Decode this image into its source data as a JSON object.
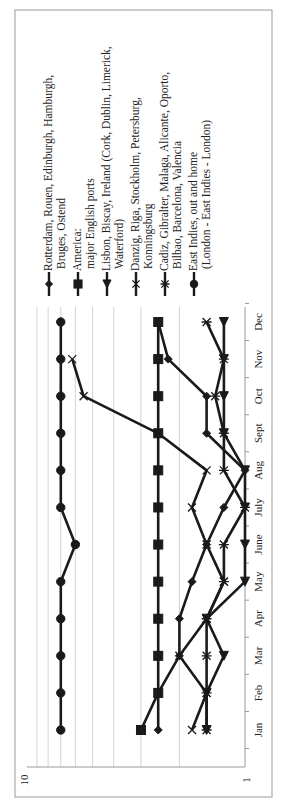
{
  "chart_data": {
    "type": "line",
    "title": "",
    "xlabel": "",
    "ylabel": "",
    "yscale": "log",
    "ylim": [
      1,
      10
    ],
    "y_tick_labels": [
      "10",
      "1"
    ],
    "grid": true,
    "orientation": "rotated 90 degrees counter-clockwise (x axis runs vertically)",
    "legend_position": "right of plot",
    "categories": [
      "Jan",
      "Feb",
      "Mar",
      "Apr",
      "May",
      "June",
      "July",
      "Aug",
      "Sept",
      "Oct",
      "Nov",
      "Dec"
    ],
    "series": [
      {
        "name": "Rotterdam, Rouen, Edinburgh, Hamburgh, Bruges, Ostend",
        "marker": "diamond",
        "values": [
          2.5,
          2.5,
          2.0,
          2.0,
          1.75,
          1.5,
          1.25,
          1.0,
          1.5,
          1.5,
          2.25,
          2.5
        ]
      },
      {
        "name": "America: major English ports",
        "marker": "square",
        "values": [
          3.0,
          2.5,
          2.5,
          2.5,
          2.5,
          2.5,
          2.5,
          2.5,
          2.5,
          2.5,
          2.5,
          2.5
        ]
      },
      {
        "name": "Lisbon, Biscay, Ireland (Cork, Dublin, Limerick, Waterford)",
        "marker": "triangle",
        "values": [
          1.5,
          1.5,
          1.25,
          1.5,
          1.0,
          1.0,
          1.0,
          1.0,
          1.25,
          1.25,
          1.25,
          1.25
        ]
      },
      {
        "name": "Danzig, Riga, Stockholm, Petersburg, Konningsburg",
        "marker": "x",
        "values": [
          1.75,
          1.5,
          2.0,
          1.5,
          1.25,
          1.5,
          1.75,
          1.5,
          2.5,
          5.5,
          6.2,
          null
        ]
      },
      {
        "name": "Cadiz, Gibralter, Malaga, Alicante, Oporto, Bilbao, Barcelona, Valencia",
        "marker": "star",
        "values": [
          1.5,
          1.5,
          1.5,
          1.5,
          1.25,
          1.25,
          1.0,
          1.25,
          1.25,
          1.37,
          1.25,
          1.5
        ]
      },
      {
        "name": "East Indies, out and home (London - East Indies - London)",
        "marker": "circle",
        "values": [
          7,
          7,
          7,
          7,
          7,
          6,
          7,
          7,
          7,
          7,
          7,
          7
        ]
      }
    ]
  },
  "legend": [
    {
      "lines": [
        "Rotterdam, Rouen, Edinburgh, Hamburgh,",
        "Bruges, Ostend"
      ],
      "marker": "diamond"
    },
    {
      "lines": [
        "America:",
        "major English ports"
      ],
      "marker": "square"
    },
    {
      "lines": [
        "Lisbon, Biscay, Ireland (Cork, Dublin, Limerick,",
        "Waterford)"
      ],
      "marker": "triangle"
    },
    {
      "lines": [
        "Danzig, Riga, Stockholm, Petersburg,",
        "Konningsburg"
      ],
      "marker": "x"
    },
    {
      "lines": [
        "Cadiz, Gibralter, Malaga, Alicante, Oporto,",
        "Bilbao, Barcelona, Valencia"
      ],
      "marker": "star"
    },
    {
      "lines": [
        "East Indies, out and home",
        "(London - East Indies - London)"
      ],
      "marker": "circle"
    }
  ],
  "axis": {
    "y_top_label": "10",
    "y_bottom_label": "1"
  }
}
